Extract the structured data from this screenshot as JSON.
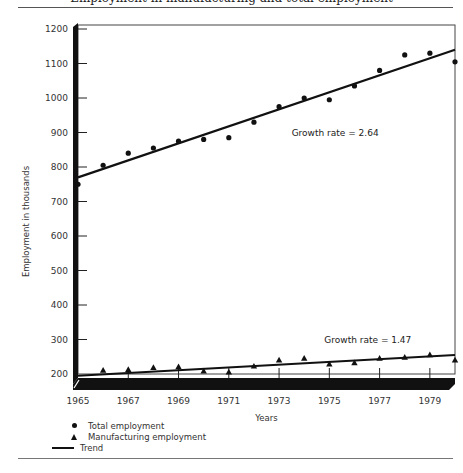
{
  "header": {
    "title_clipped": "Employment in manufacturing and total employment"
  },
  "chart_data": {
    "type": "scatter",
    "title": "",
    "xlabel": "Years",
    "ylabel": "Employment in thousands",
    "x_ticks": [
      1965,
      1967,
      1969,
      1971,
      1973,
      1975,
      1977,
      1979
    ],
    "y_ticks": [
      200,
      300,
      400,
      500,
      600,
      700,
      800,
      900,
      1000,
      1100,
      1200
    ],
    "xlim": [
      1965,
      1980
    ],
    "ylim": [
      200,
      1200
    ],
    "grid": false,
    "legend_position": "bottom-left",
    "series": [
      {
        "name": "Total employment",
        "marker": "circle",
        "x": [
          1965,
          1966,
          1967,
          1968,
          1969,
          1970,
          1971,
          1972,
          1973,
          1974,
          1975,
          1976,
          1977,
          1978,
          1979,
          1980
        ],
        "values": [
          750,
          805,
          840,
          855,
          875,
          880,
          885,
          930,
          975,
          1000,
          995,
          1035,
          1080,
          1125,
          1130,
          1105
        ],
        "trend": {
          "start": [
            1965,
            770
          ],
          "end": [
            1980,
            1140
          ]
        }
      },
      {
        "name": "Manufacturing employment",
        "marker": "triangle",
        "x": [
          1966,
          1967,
          1968,
          1969,
          1970,
          1971,
          1972,
          1973,
          1974,
          1975,
          1976,
          1977,
          1978,
          1979,
          1980
        ],
        "values": [
          210,
          212,
          218,
          220,
          208,
          205,
          222,
          240,
          245,
          228,
          232,
          245,
          248,
          255,
          240
        ],
        "trend": {
          "start": [
            1965,
            195
          ],
          "end": [
            1980,
            255
          ]
        }
      }
    ],
    "annotations": [
      {
        "text": "Growth rate = 2.64",
        "x": 1973.5,
        "y": 890
      },
      {
        "text": "Growth rate = 1.47",
        "x": 1974.8,
        "y": 290
      }
    ]
  },
  "legend": {
    "items": [
      {
        "symbol": "circle",
        "label": "Total employment"
      },
      {
        "symbol": "triangle",
        "label": "Manufacturing employment"
      },
      {
        "symbol": "line",
        "label": "Trend"
      }
    ]
  }
}
